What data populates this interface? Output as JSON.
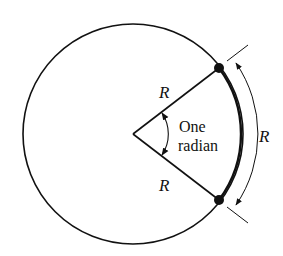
{
  "diagram": {
    "labels": {
      "radius_upper": "R",
      "radius_lower": "R",
      "arc_length": "R",
      "angle_line1": "One",
      "angle_line2": "radian"
    },
    "colors": {
      "stroke": "#111111",
      "background": "#ffffff"
    }
  }
}
